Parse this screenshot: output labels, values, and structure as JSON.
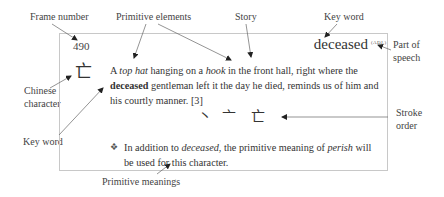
{
  "labels": {
    "frame_number": "Frame number",
    "primitive_elements": "Primitive elements",
    "story": "Story",
    "key_word_top": "Key word",
    "part_of_speech_1": "Part of",
    "part_of_speech_2": "speech",
    "chinese_character_1": "Chinese",
    "chinese_character_2": "character",
    "key_word_left": "Key word",
    "stroke_order_1": "Stroke",
    "stroke_order_2": "order",
    "primitive_meanings": "Primitive meanings"
  },
  "entry": {
    "frame_number": "490",
    "character": "亡",
    "key_word": "deceased",
    "part_of_speech": "(ADJ.)",
    "story": {
      "p1": "A ",
      "top_hat": "top hat",
      "p2": " hanging on a ",
      "hook": "hook",
      "p3": " in the front hall, right where the ",
      "deceased": "deceased",
      "p4": " gentleman left it the day he died, reminds us of him and his courtly manner. [3]"
    },
    "stroke_order": [
      "丶",
      "亠",
      "亡"
    ],
    "primitive_note": {
      "bullet": "❖",
      "p1": "In addition to ",
      "deceased": "deceased",
      "p2": ", the primitive meaning of ",
      "perish": "perish",
      "p3": " will be used for this character."
    }
  }
}
